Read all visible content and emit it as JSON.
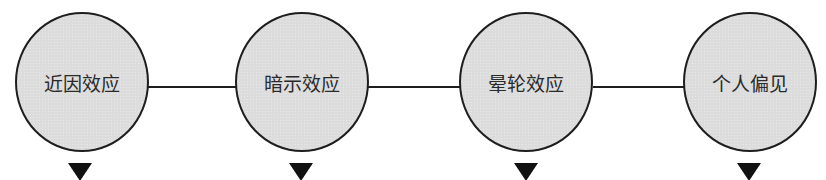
{
  "diagram": {
    "nodes": [
      {
        "label": "近因效应"
      },
      {
        "label": "暗示效应"
      },
      {
        "label": "晕轮效应"
      },
      {
        "label": "个人偏见"
      }
    ],
    "connectors": 3,
    "arrows": 4,
    "colors": {
      "node_fill": "#dcdcdc",
      "stroke": "#1e1e1e",
      "arrow": "#111111"
    }
  }
}
